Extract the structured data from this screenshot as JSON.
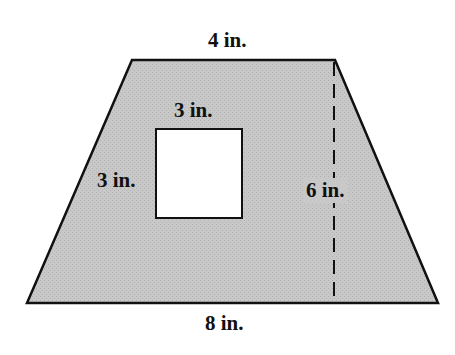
{
  "figure": {
    "shape": "trapezoid-with-square-cutout",
    "colors": {
      "fill": "#c4c4c4",
      "stroke": "#111111",
      "hole": "#ffffff"
    },
    "labels": {
      "top_base": "4 in.",
      "bottom_base": "8 in.",
      "height": "6 in.",
      "square_top": "3 in.",
      "square_side": "3 in."
    }
  }
}
